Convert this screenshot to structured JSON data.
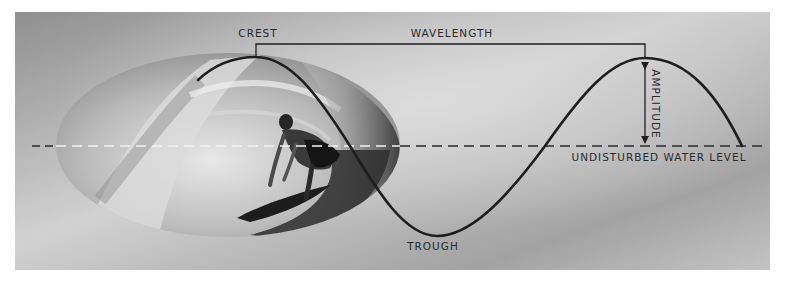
{
  "diagram": {
    "labels": {
      "crest": "CREST",
      "wavelength": "WAVELENGTH",
      "amplitude": "AMPLITUDE",
      "trough": "TROUGH",
      "water_level": "UNDISTURBED WATER LEVEL"
    },
    "photo": {
      "subject": "surfer riding inside a breaking wave barrel",
      "shape": "ellipse",
      "tone": "grayscale"
    },
    "colors": {
      "background_light": "#c9c9c9",
      "background_dark": "#8a8a8a",
      "curve": "#1e1e1e",
      "dash_outside": "#2a2a2a",
      "dash_inside": "#f2f2f2",
      "label_text": "#2a2a2a"
    }
  }
}
